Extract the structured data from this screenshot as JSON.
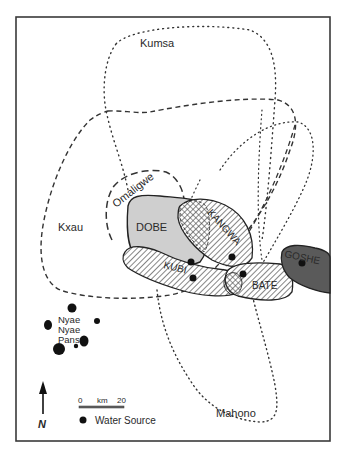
{
  "map": {
    "territories": {
      "kumsa": "Kumsa",
      "kxau": "Kxau",
      "omaligwe": "Omaligwe",
      "dobe": "DOBE",
      "kangwa": "KANGWA",
      "kubi": "KUBI",
      "bate": "BATE",
      "goshe": "GOSHE",
      "mahono": "Mahono"
    },
    "places": {
      "nyae_line1": "Nyae",
      "nyae_line2": "Nyae",
      "nyae_line3": "Pans"
    },
    "legend": {
      "north_label": "N",
      "scale_start": "0",
      "scale_unit": "km",
      "scale_end": "20",
      "water_source_label": "Water Source"
    },
    "colors": {
      "frame": "#3a3a3a",
      "dobe_fill": "#cfcfcf",
      "goshe_fill": "#5a5a5a",
      "hatch": "#444444",
      "ink": "#222222"
    }
  }
}
